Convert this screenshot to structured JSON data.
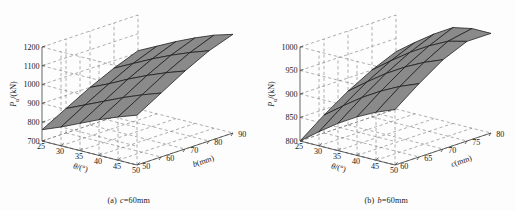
{
  "figure": {
    "background_color": "#fdfdfd",
    "surface_color": "#8a8a8a",
    "surface_edge_color": "#1a1a1a",
    "grid_color": "#6e6e6e",
    "axis_color": "#4a4a4a"
  },
  "panels": [
    {
      "id": "panel-a",
      "caption_label": "(a)",
      "caption_var": "c",
      "caption_text": "=60mm",
      "caption_full": "(a)  c=60mm",
      "zaxis": {
        "label_var": "P",
        "label_sub": "u",
        "label_unit": "/(kN)",
        "label_full": "Pu/(kN)",
        "ticks": [
          "700",
          "800",
          "900",
          "1000",
          "1100",
          "1200"
        ],
        "min": 700,
        "max": 1200,
        "step": 100
      },
      "xaxis": {
        "label_var": "θ",
        "label_unit": "/(°)",
        "label_full": "θ/(°)",
        "ticks": [
          "25",
          "30",
          "35",
          "40",
          "45",
          "50"
        ],
        "min": 25,
        "max": 50,
        "step": 5
      },
      "yaxis": {
        "label_var": "b",
        "label_unit": "(mm)",
        "label_full": "b(mm)",
        "ticks": [
          "50",
          "60",
          "70",
          "80",
          "90"
        ],
        "min": 50,
        "max": 90,
        "step": 10
      }
    },
    {
      "id": "panel-b",
      "caption_label": "(b)",
      "caption_var": "b",
      "caption_text": "=60mm",
      "caption_full": "(b)  b=60mm",
      "zaxis": {
        "label_var": "P",
        "label_sub": "u",
        "label_unit": "/(kN)",
        "label_full": "Pu/(kN)",
        "ticks": [
          "800",
          "850",
          "900",
          "950",
          "1000"
        ],
        "min": 800,
        "max": 1000,
        "step": 50
      },
      "xaxis": {
        "label_var": "θ",
        "label_unit": "/(°)",
        "label_full": "θ/(°)",
        "ticks": [
          "25",
          "30",
          "35",
          "40",
          "45",
          "50"
        ],
        "min": 25,
        "max": 50,
        "step": 5
      },
      "yaxis": {
        "label_var": "c",
        "label_unit": "(mm)",
        "label_full": "c(mm)",
        "ticks": [
          "60",
          "65",
          "70",
          "75",
          "80"
        ],
        "min": 60,
        "max": 80,
        "step": 5
      }
    }
  ],
  "chart_data": [
    {
      "type": "surface",
      "title": "(a)  c=60mm",
      "xlabel": "θ/(°)",
      "ylabel": "b(mm)",
      "zlabel": "Pu/(kN)",
      "xlim": [
        25,
        50
      ],
      "ylim": [
        50,
        90
      ],
      "zlim": [
        700,
        1200
      ],
      "x": [
        25,
        30,
        35,
        40,
        45,
        50
      ],
      "y": [
        50,
        60,
        70,
        80,
        90
      ],
      "grid": true,
      "legend": "none",
      "z": [
        [
          760,
          800,
          845,
          890,
          930,
          965
        ],
        [
          830,
          875,
          920,
          965,
          1005,
          1040
        ],
        [
          900,
          945,
          995,
          1040,
          1080,
          1115
        ],
        [
          960,
          1010,
          1060,
          1105,
          1145,
          1180
        ],
        [
          1010,
          1060,
          1110,
          1155,
          1195,
          1225
        ]
      ]
    },
    {
      "type": "surface",
      "title": "(b)  b=60mm",
      "xlabel": "θ/(°)",
      "ylabel": "c(mm)",
      "zlabel": "Pu/(kN)",
      "xlim": [
        25,
        50
      ],
      "ylim": [
        60,
        80
      ],
      "zlim": [
        800,
        1000
      ],
      "x": [
        25,
        30,
        35,
        40,
        45,
        50
      ],
      "y": [
        60,
        65,
        70,
        75,
        80
      ],
      "grid": true,
      "legend": "none",
      "z": [
        [
          800,
          830,
          858,
          882,
          902,
          918
        ],
        [
          838,
          868,
          896,
          920,
          940,
          956
        ],
        [
          872,
          902,
          930,
          954,
          974,
          990
        ],
        [
          900,
          930,
          958,
          982,
          1002,
          1018
        ],
        [
          922,
          952,
          980,
          1004,
          1024,
          1040
        ]
      ]
    }
  ]
}
